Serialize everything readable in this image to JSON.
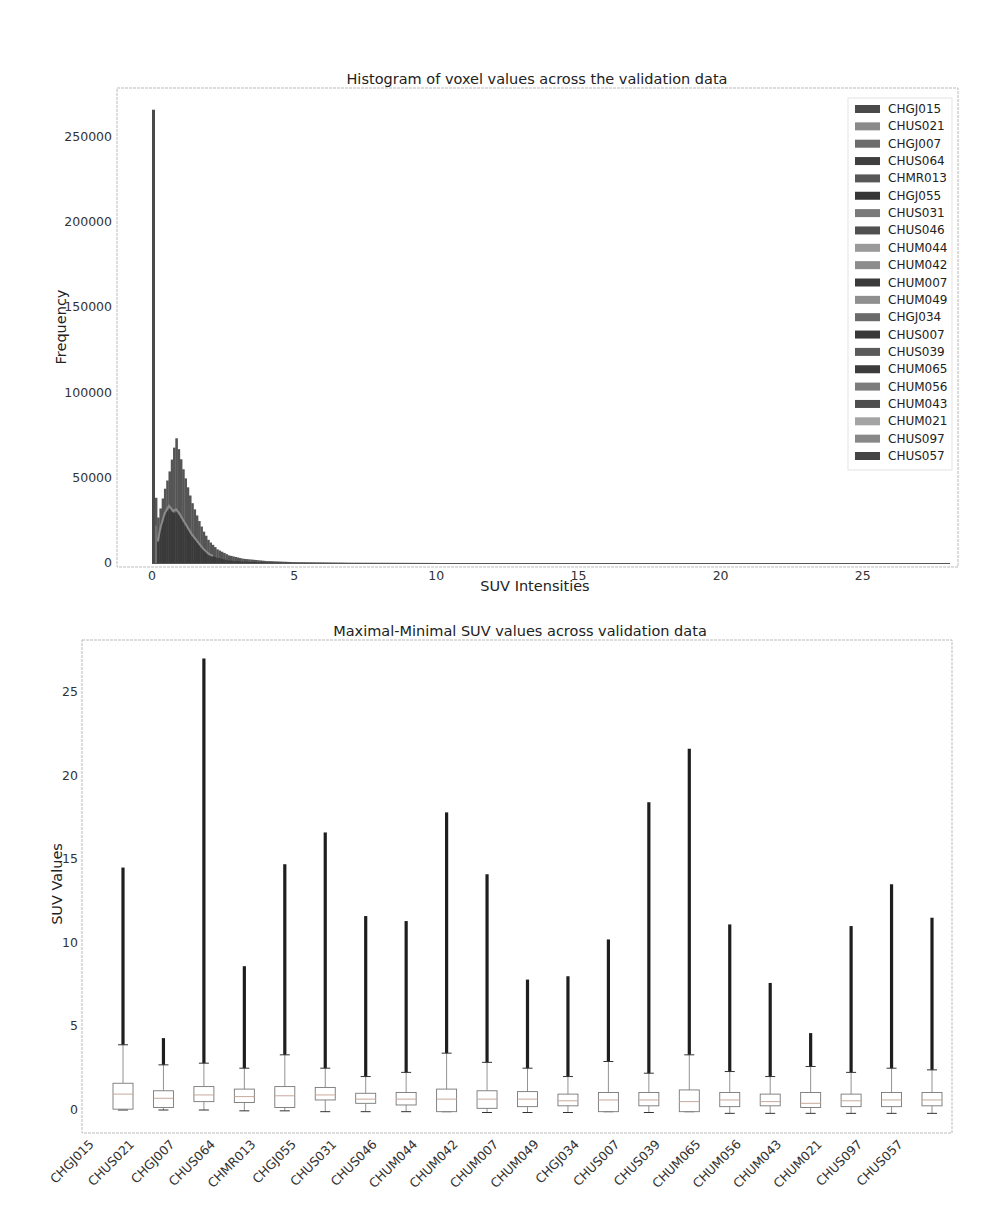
{
  "chart_data": [
    {
      "type": "histogram",
      "title": "Histogram of voxel values across the validation data",
      "xlabel": "SUV Intensities",
      "ylabel": "Frequency",
      "xlim": [
        -1.2,
        28.5
      ],
      "ylim": [
        0,
        280000
      ],
      "xticks": [
        0,
        5,
        10,
        15,
        20,
        25
      ],
      "yticks": [
        0,
        50000,
        100000,
        150000,
        200000,
        250000
      ],
      "grid": false,
      "legend_position": "upper right",
      "legend": [
        "CHGJ015",
        "CHUS021",
        "CHGJ007",
        "CHUS064",
        "CHMR013",
        "CHGJ055",
        "CHUS031",
        "CHUS046",
        "CHUM044",
        "CHUM042",
        "CHUM007",
        "CHUM049",
        "CHGJ034",
        "CHUS007",
        "CHUS039",
        "CHUM065",
        "CHUM056",
        "CHUM043",
        "CHUM021",
        "CHUS097",
        "CHUS057"
      ],
      "legend_colors": [
        "#4a4a4a",
        "#8a8a8a",
        "#6c6c6c",
        "#3f3f3f",
        "#575757",
        "#363636",
        "#7a7a7a",
        "#505050",
        "#9a9a9a",
        "#8c8c8c",
        "#3a3a3a",
        "#8f8f8f",
        "#6a6a6a",
        "#383838",
        "#5a5a5a",
        "#3c3c3c",
        "#7c7c7c",
        "#4e4e4e",
        "#a4a4a4",
        "#888888",
        "#444444"
      ],
      "annotations": {
        "spike_at_zero": 266000,
        "secondary_peak_x": 0.85,
        "secondary_peak_y": 74000,
        "envelope_x": [
          0.0,
          0.15,
          0.3,
          0.45,
          0.6,
          0.75,
          0.85,
          0.95,
          1.1,
          1.25,
          1.4,
          1.6,
          1.8,
          2.0,
          2.3,
          2.7,
          3.2,
          4.0,
          5.0,
          7.0,
          10.0
        ],
        "envelope_y": [
          266000,
          22000,
          32000,
          43000,
          52000,
          65000,
          74000,
          66000,
          55000,
          45000,
          36000,
          27000,
          19000,
          13000,
          8000,
          4500,
          2500,
          1200,
          500,
          150,
          30
        ],
        "inner_series_y": [
          20000,
          8000,
          20000,
          28000,
          32000,
          29000,
          30000,
          28000,
          24000,
          20000,
          16000,
          12000,
          8000,
          5000,
          3000,
          1500,
          800,
          300,
          100,
          30,
          5
        ]
      }
    },
    {
      "type": "box",
      "title": "Maximal-Minimal SUV values across validation data",
      "xlabel": "",
      "ylabel": "SUV Values",
      "ylim": [
        -1.4,
        28.1
      ],
      "yticks": [
        0,
        5,
        10,
        15,
        20,
        25
      ],
      "grid": false,
      "categories": [
        "CHGJ015",
        "CHUS021",
        "CHGJ007",
        "CHUS064",
        "CHMR013",
        "CHGJ055",
        "CHUS031",
        "CHUS046",
        "CHUM044",
        "CHUM042",
        "CHUM007",
        "CHUM049",
        "CHGJ034",
        "CHUS007",
        "CHUS039",
        "CHUM065",
        "CHUM056",
        "CHUM043",
        "CHUM021",
        "CHUS097",
        "CHUS057"
      ],
      "boxes": [
        {
          "q1": 0.05,
          "median": 0.95,
          "q3": 1.6,
          "whislo": 0.0,
          "whishi": 3.9,
          "fliers_max": 14.5
        },
        {
          "q1": 0.15,
          "median": 0.7,
          "q3": 1.15,
          "whislo": 0.0,
          "whishi": 2.7,
          "fliers_max": 4.3
        },
        {
          "q1": 0.5,
          "median": 0.9,
          "q3": 1.4,
          "whislo": 0.0,
          "whishi": 2.8,
          "fliers_max": 27.0
        },
        {
          "q1": 0.45,
          "median": 0.8,
          "q3": 1.25,
          "whislo": -0.05,
          "whishi": 2.5,
          "fliers_max": 8.6
        },
        {
          "q1": 0.15,
          "median": 0.85,
          "q3": 1.4,
          "whislo": -0.05,
          "whishi": 3.3,
          "fliers_max": 14.7
        },
        {
          "q1": 0.6,
          "median": 0.9,
          "q3": 1.35,
          "whislo": -0.1,
          "whishi": 2.5,
          "fliers_max": 16.6
        },
        {
          "q1": 0.4,
          "median": 0.65,
          "q3": 1.0,
          "whislo": -0.1,
          "whishi": 2.0,
          "fliers_max": 11.6
        },
        {
          "q1": 0.3,
          "median": 0.65,
          "q3": 1.05,
          "whislo": -0.1,
          "whishi": 2.25,
          "fliers_max": 11.3
        },
        {
          "q1": -0.1,
          "median": 0.65,
          "q3": 1.25,
          "whislo": -0.1,
          "whishi": 3.4,
          "fliers_max": 17.8
        },
        {
          "q1": 0.1,
          "median": 0.65,
          "q3": 1.15,
          "whislo": -0.15,
          "whishi": 2.85,
          "fliers_max": 14.1
        },
        {
          "q1": 0.2,
          "median": 0.65,
          "q3": 1.1,
          "whislo": -0.15,
          "whishi": 2.5,
          "fliers_max": 7.8
        },
        {
          "q1": 0.25,
          "median": 0.55,
          "q3": 0.95,
          "whislo": -0.15,
          "whishi": 2.0,
          "fliers_max": 8.0
        },
        {
          "q1": -0.1,
          "median": 0.6,
          "q3": 1.05,
          "whislo": -0.1,
          "whishi": 2.9,
          "fliers_max": 10.2
        },
        {
          "q1": 0.25,
          "median": 0.6,
          "q3": 1.05,
          "whislo": -0.15,
          "whishi": 2.2,
          "fliers_max": 18.4
        },
        {
          "q1": -0.1,
          "median": 0.5,
          "q3": 1.2,
          "whislo": -0.1,
          "whishi": 3.3,
          "fliers_max": 21.6
        },
        {
          "q1": 0.2,
          "median": 0.6,
          "q3": 1.05,
          "whislo": -0.2,
          "whishi": 2.3,
          "fliers_max": 11.1
        },
        {
          "q1": 0.25,
          "median": 0.5,
          "q3": 0.95,
          "whislo": -0.2,
          "whishi": 2.0,
          "fliers_max": 7.6
        },
        {
          "q1": 0.15,
          "median": 0.4,
          "q3": 1.05,
          "whislo": -0.2,
          "whishi": 2.6,
          "fliers_max": 4.6
        },
        {
          "q1": 0.2,
          "median": 0.55,
          "q3": 0.95,
          "whislo": -0.2,
          "whishi": 2.25,
          "fliers_max": 11.0
        },
        {
          "q1": 0.2,
          "median": 0.6,
          "q3": 1.05,
          "whislo": -0.2,
          "whishi": 2.5,
          "fliers_max": 13.5
        },
        {
          "q1": 0.25,
          "median": 0.6,
          "q3": 1.05,
          "whislo": -0.2,
          "whishi": 2.4,
          "fliers_max": 11.5
        }
      ],
      "tick_label_note": "tick labels are offset one position left of the boxes"
    }
  ],
  "colors": {
    "frame": "#bbbbbb",
    "outlier": "#1e1e1e",
    "box_edge": "#777777",
    "median": "#c8a89c"
  }
}
